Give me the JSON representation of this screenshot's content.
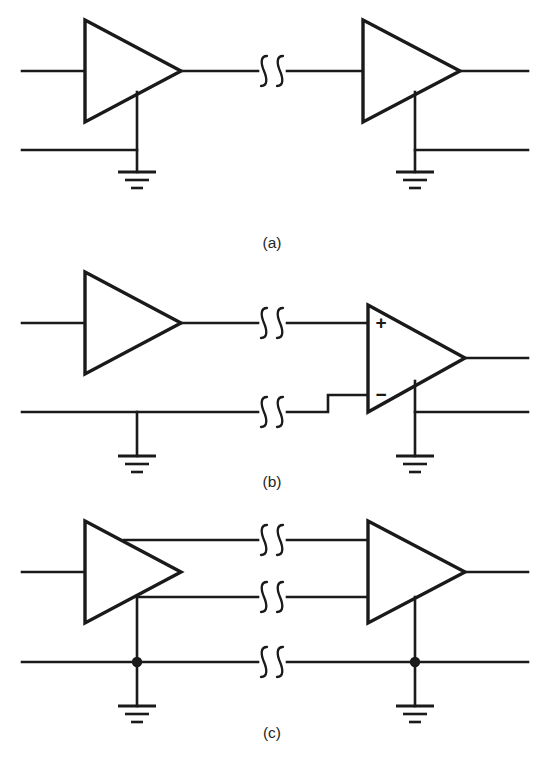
{
  "figure": {
    "background_color": "#ffffff",
    "line_color": "#1a1a1a",
    "width": 544,
    "height": 762
  },
  "panels": [
    {
      "id": "a",
      "label": "(a)",
      "label_x": 272,
      "label_y": 248,
      "description": "Single-ended amplifier to single-ended amplifier, single signal wire with ground return",
      "amplifiers": [
        {
          "name": "source-amplifier",
          "type": "single-ended",
          "x1": 85,
          "y1": 20,
          "x2": 85,
          "y2": 122,
          "apex_x": 181,
          "apex_y": 71
        },
        {
          "name": "receiver-amplifier",
          "type": "single-ended",
          "x1": 363,
          "y1": 20,
          "x2": 363,
          "y2": 122,
          "apex_x": 460,
          "apex_y": 71
        }
      ],
      "grounds": [
        {
          "name": "source-ground",
          "x": 137,
          "y": 172
        },
        {
          "name": "receiver-ground",
          "x": 415,
          "y": 172
        }
      ],
      "squiggles": [
        {
          "name": "cable-break-signal",
          "x": 272,
          "y": 71
        }
      ]
    },
    {
      "id": "b",
      "label": "(b)",
      "label_x": 272,
      "label_y": 487,
      "description": "Single-ended amplifier driving a differential amplifier, two-wire signal pair",
      "amplifiers": [
        {
          "name": "source-amplifier",
          "type": "single-ended",
          "x1": 85,
          "y1": 272,
          "x2": 85,
          "y2": 374,
          "apex_x": 181,
          "apex_y": 323
        },
        {
          "name": "differential-receiver-amplifier",
          "type": "differential",
          "x1": 368,
          "y1": 305,
          "x2": 368,
          "y2": 412,
          "apex_x": 465,
          "apex_y": 358
        }
      ],
      "pin_labels": [
        {
          "name": "plus-input-label",
          "text": "+",
          "x": 381,
          "y": 322
        },
        {
          "name": "minus-input-label",
          "text": "−",
          "x": 381,
          "y": 396
        }
      ],
      "grounds": [
        {
          "name": "source-ground",
          "x": 137,
          "y": 413
        },
        {
          "name": "receiver-ground",
          "x": 415,
          "y": 413
        }
      ],
      "squiggles": [
        {
          "name": "cable-break-signal-high",
          "x": 272,
          "y": 323
        },
        {
          "name": "cable-break-signal-low",
          "x": 272,
          "y": 412
        }
      ]
    },
    {
      "id": "c",
      "label": "(c)",
      "label_x": 272,
      "label_y": 738,
      "description": "Differential amplifier pair with three wires: two signal lines plus a grounded shield/common line with junction dots",
      "amplifiers": [
        {
          "name": "source-amplifier",
          "type": "differential-out",
          "x1": 85,
          "y1": 521,
          "x2": 85,
          "y2": 623,
          "apex_x": 181,
          "apex_y": 572
        },
        {
          "name": "receiver-amplifier",
          "type": "differential-in",
          "x1": 368,
          "y1": 521,
          "x2": 368,
          "y2": 623,
          "apex_x": 465,
          "apex_y": 572
        }
      ],
      "grounds": [
        {
          "name": "source-ground",
          "x": 137,
          "y": 662
        },
        {
          "name": "receiver-ground",
          "x": 415,
          "y": 662
        }
      ],
      "junction_dots": [
        {
          "name": "source-ground-junction",
          "x": 137,
          "y": 662
        },
        {
          "name": "receiver-ground-junction",
          "x": 415,
          "y": 662
        }
      ],
      "squiggles": [
        {
          "name": "cable-break-signal-high",
          "x": 272,
          "y": 540
        },
        {
          "name": "cable-break-signal-low",
          "x": 272,
          "y": 597
        },
        {
          "name": "cable-break-common",
          "x": 272,
          "y": 662
        }
      ]
    }
  ]
}
